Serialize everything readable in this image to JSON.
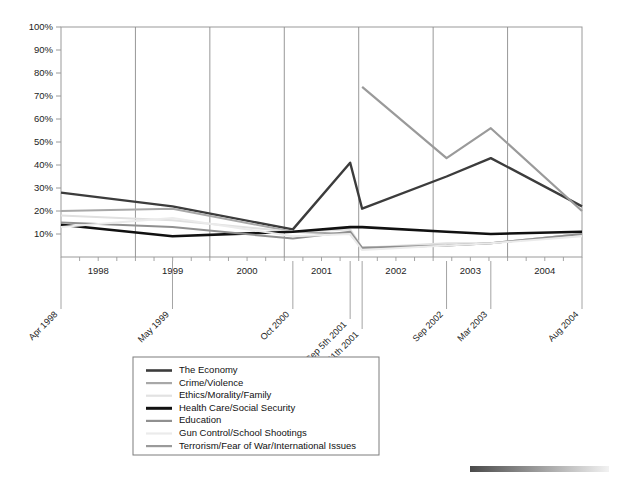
{
  "chart_data": {
    "type": "line",
    "title": "",
    "subtitle": "",
    "xlabel": "",
    "ylabel": "",
    "ylim": [
      0,
      100
    ],
    "y_ticks": [
      "10%",
      "20%",
      "30%",
      "40%",
      "50%",
      "60%",
      "70%",
      "80%",
      "90%",
      "100%"
    ],
    "y_tick_values": [
      10,
      20,
      30,
      40,
      50,
      60,
      70,
      80,
      90,
      100
    ],
    "grid": "vertical-year-gridlines",
    "legend_position": "below-plot-left-center",
    "x_axis_year_labels": [
      "1998",
      "1999",
      "2000",
      "2001",
      "2002",
      "2003",
      "2004"
    ],
    "x": [
      "Apr 1998",
      "May 1999",
      "Oct 2000",
      "Sep 5th 2001",
      "Oct 11th 2001",
      "Sep 2002",
      "Mar 2003",
      "Aug 2004"
    ],
    "x_positions": [
      0.0,
      0.214,
      0.445,
      0.555,
      0.578,
      0.74,
      0.825,
      1.0
    ],
    "series": [
      {
        "name": "The Economy",
        "color": "#3c3c3c",
        "width": 2.4,
        "values": [
          28,
          22,
          12,
          41,
          21,
          35,
          43,
          22
        ]
      },
      {
        "name": "Crime/Violence",
        "color": "#a8a8a8",
        "width": 2.0,
        "values": [
          20,
          21,
          11,
          10,
          4,
          5,
          6,
          10
        ]
      },
      {
        "name": "Ethics/Morality/Family",
        "color": "#e0e0e0",
        "width": 2.0,
        "values": [
          18,
          16,
          11,
          12,
          4,
          6,
          6,
          10
        ]
      },
      {
        "name": "Health Care/Social Security",
        "color": "#111111",
        "width": 2.6,
        "values": [
          14,
          9,
          11,
          13,
          13,
          11,
          10,
          11
        ]
      },
      {
        "name": "Education",
        "color": "#909090",
        "width": 2.0,
        "values": [
          15,
          13,
          8,
          11,
          4,
          5,
          6,
          10
        ]
      },
      {
        "name": "Gun Control/School Shootings",
        "color": "#ebebeb",
        "width": 2.0,
        "values": [
          13,
          17,
          9,
          10,
          3,
          5,
          6,
          9
        ]
      },
      {
        "name": "Terrorism/Fear of War/International Issues",
        "color": "#9a9a9a",
        "width": 2.2,
        "values": [
          null,
          null,
          null,
          null,
          74,
          43,
          56,
          20
        ]
      }
    ]
  },
  "legend": {
    "items": [
      {
        "label": "The Economy",
        "color": "#3c3c3c",
        "width": 2.6
      },
      {
        "label": "Crime/Violence",
        "color": "#a8a8a8",
        "width": 2.2
      },
      {
        "label": "Ethics/Morality/Family",
        "color": "#e2e2e2",
        "width": 2.2
      },
      {
        "label": "Health Care/Social Security",
        "color": "#111111",
        "width": 3.0
      },
      {
        "label": "Education",
        "color": "#909090",
        "width": 2.2
      },
      {
        "label": "Gun Control/School Shootings",
        "color": "#ebebeb",
        "width": 2.2
      },
      {
        "label": "Terrorism/Fear of War/International Issues",
        "color": "#9a9a9a",
        "width": 2.2
      }
    ]
  },
  "footer_bar": {
    "name": "gradient-bar",
    "from_color": "#4a4a4a",
    "to_color": "#f2f2f2"
  },
  "colors": {
    "axis": "#9a9a9a",
    "gridline": "#8c8c8c",
    "text": "#1d1d1d",
    "legend_border": "#7d7d7d"
  }
}
